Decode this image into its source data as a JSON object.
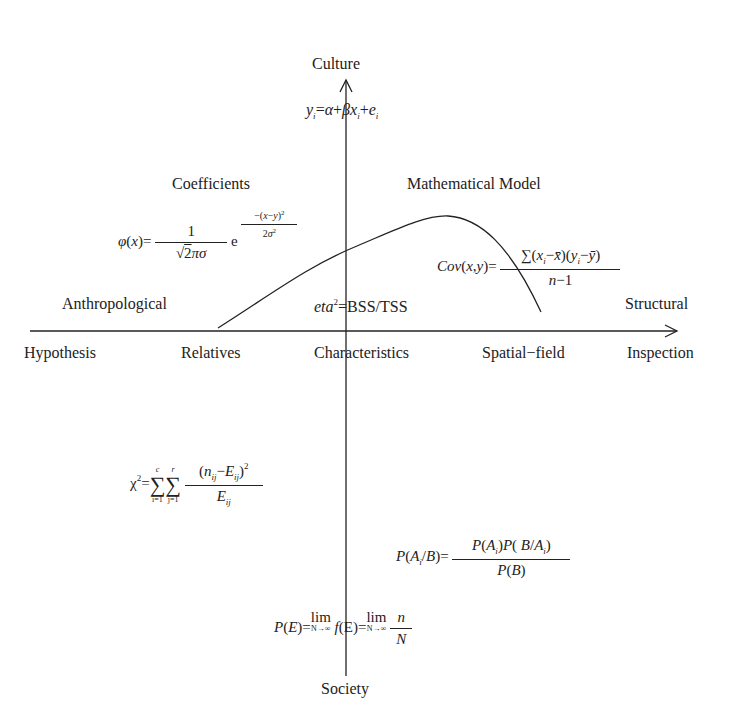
{
  "axes": {
    "y_top_label": "Culture",
    "y_bottom_label": "Society",
    "x_left_labels": [
      "Anthropological",
      "Hypothesis"
    ],
    "x_right_labels": [
      "Structural",
      "Inspection"
    ]
  },
  "x_axis_labels": {
    "hypothesis": "Hypothesis",
    "relatives": "Relatives",
    "characteristics": "Characteristics",
    "spatial_field": "Spatial−field",
    "inspection": "Inspection"
  },
  "quadrant_labels": {
    "anthropological": "Anthropological",
    "structural": "Structural",
    "coefficients": "Coefficients",
    "mathematical_model": "Mathematical Model"
  },
  "formulas": {
    "regression": "y_i = α + βx_i + e_i",
    "normal_pdf": "φ(x) = 1/(√(2π)σ) e^(−(x−y)²/2σ²)",
    "covariance": "Cov(x,y) = ∑(x_i−x̄)(y_i−ȳ)/(n−1)",
    "eta_squared": "eta² = BSS/TSS",
    "chi_square": "χ² = ∑_{i=1}^{c} ∑_{j=1}^{r} (n_ij−E_ij)²/E_ij",
    "bayes": "P(A_i/B) = P(A_i)P(B/A_i)/P(B)",
    "probability_limit": "P(E) = lim_{N→∞} f(E) = lim_{N→∞} n/N"
  },
  "curve": {
    "points": [
      [
        218,
        328
      ],
      [
        357,
        246
      ],
      [
        448,
        216
      ],
      [
        541,
        312
      ]
    ],
    "color": "#222222"
  }
}
